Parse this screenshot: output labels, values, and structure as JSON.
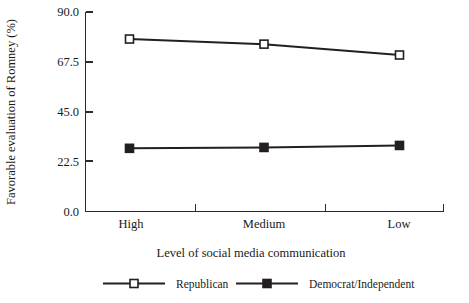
{
  "chart_data": {
    "type": "line",
    "title": "",
    "xlabel": "Level of social media communication",
    "ylabel": "Favorable evaluation of Romney (%)",
    "categories": [
      "High",
      "Medium",
      "Low"
    ],
    "ylim": [
      0.0,
      90.0
    ],
    "yticks": [
      0.0,
      22.5,
      45.0,
      67.5,
      90.0
    ],
    "ytick_labels": [
      "0.0",
      "22.5",
      "45.0",
      "67.5",
      "90.0"
    ],
    "grid": false,
    "legend_position": "bottom",
    "series": [
      {
        "name": "Republican",
        "marker": "open-square",
        "color": "#231f20",
        "values": [
          77.8,
          75.5,
          70.6
        ]
      },
      {
        "name": "Democrat/Independent",
        "marker": "filled-square",
        "color": "#231f20",
        "values": [
          28.5,
          28.9,
          29.8
        ]
      }
    ]
  },
  "axes": {
    "y_label_text": "Favorable evaluation of Romney (%)",
    "x_label_text": "Level of social media communication",
    "y_tick_0": "0.0",
    "y_tick_1": "22.5",
    "y_tick_2": "45.0",
    "y_tick_3": "67.5",
    "y_tick_4": "90.0",
    "x_cat_0": "High",
    "x_cat_1": "Medium",
    "x_cat_2": "Low"
  },
  "legend": {
    "entry_0_label": "Republican",
    "entry_1_label": "Democrat/Independent"
  }
}
